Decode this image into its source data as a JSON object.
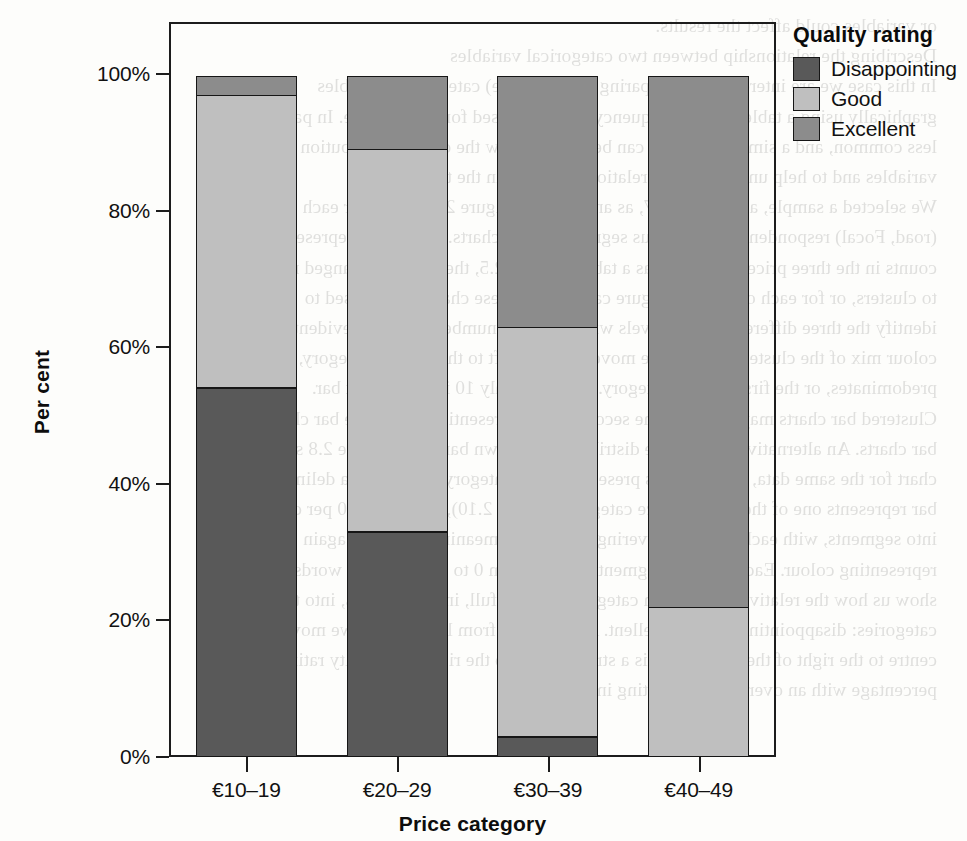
{
  "legend": {
    "title": "Quality rating",
    "entries": [
      {
        "label": "Disappointing",
        "color": "#595959"
      },
      {
        "label": "Good",
        "color": "#bfbfbf"
      },
      {
        "label": "Excellent",
        "color": "#8c8c8c"
      }
    ]
  },
  "axes": {
    "y_label": "Per cent",
    "x_label": "Price category",
    "y_ticks": [
      "0%",
      "20%",
      "40%",
      "60%",
      "80%",
      "100%"
    ],
    "x_ticks": [
      "€10–19",
      "€20–29",
      "€30–39",
      "€40–49"
    ]
  },
  "chart_data": {
    "type": "bar",
    "stacked": true,
    "stacked_mode": "percent",
    "title": "",
    "xlabel": "Price category",
    "ylabel": "Per cent",
    "ylim": [
      0,
      100
    ],
    "ytick_values": [
      0,
      20,
      40,
      60,
      80,
      100
    ],
    "grid": false,
    "legend_position": "right",
    "legend_title": "Quality rating",
    "categories": [
      "€10–19",
      "€20–29",
      "€30–39",
      "€40–49"
    ],
    "series": [
      {
        "name": "Disappointing",
        "color": "#595959",
        "values": [
          54,
          33,
          3,
          0
        ]
      },
      {
        "name": "Good",
        "color": "#bfbfbf",
        "values": [
          43,
          56,
          60,
          22
        ]
      },
      {
        "name": "Excellent",
        "color": "#8c8c8c",
        "values": [
          3,
          11,
          37,
          78
        ]
      }
    ],
    "units": "per cent"
  },
  "bleed_text": {
    "lines": [
      "or variables could affect the results.",
      "Describing the relationship between two categorical variables",
      "In this case we are interested in comparing two (or more) categorical variables",
      "graphically using a table. Simple frequency tables are used for this purpose. In part",
      "less common, and a simple bar chart can be used to show the overall distribution of",
      "variables and to help understand the relationships seen in the table.",
      "We selected a sample, as in Table 2.7, as an example. Figure 2.8 shows, for each cluster",
      "(road, Focal) respondents with various segments in the charts. If each bar represents",
      "counts in the three price categories, as a table of Table 2.5, the bars are arranged next",
      "to clusters, or for each of the four Figure categories. These charts can be used to",
      "identify the three different quality levels within a small number of groups evident in the",
      "colour mix of the clusters, with as we move from the left to the right of category, where one",
      "predominates, or the first linear a category. Between Only 10 is the longest bar.",
      "Clustered bar charts may highlight the second way of presenting a multiple bar chart.",
      "bar charts. An alternative form of the distribution is shown bar chart. Figure 2.8 shows an",
      "chart for the same data, with the bars presenting each category rather than a delimit for",
      "bar represents one of the several price categories (Table 2.10), scaled to 100 per cent. The",
      "into segments, with each segment covering each value, meaning its area is again",
      "representing colour. Each of these segments ranged from 0 to 100. In other words",
      "show us how the relative size in each category is of the full, in other words, into the three",
      "categories: disappointing, good, excellent. As we move from left to right, we move from the",
      "centre to the right of the chart, there is a striking shift to the right. All quality rating",
      "percentage with an overall quality rating increases."
    ]
  }
}
